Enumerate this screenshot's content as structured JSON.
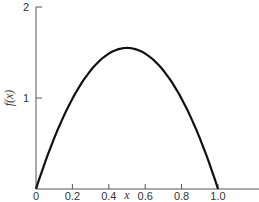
{
  "chart_data": {
    "type": "line",
    "title": "",
    "xlabel": "x",
    "ylabel": "f(x)",
    "xlim": [
      0,
      1.2
    ],
    "ylim": [
      0,
      2
    ],
    "grid": false,
    "legend": null,
    "x_ticks": [
      "0",
      "0.2",
      "0.4",
      "0.6",
      "0.8",
      "1.0"
    ],
    "y_ticks": [
      "1",
      "2"
    ],
    "series": [
      {
        "name": "f(x)",
        "x": [
          0,
          0.05,
          0.1,
          0.15,
          0.2,
          0.25,
          0.3,
          0.35,
          0.4,
          0.45,
          0.5,
          0.55,
          0.6,
          0.65,
          0.7,
          0.75,
          0.8,
          0.85,
          0.9,
          0.95,
          1.0
        ],
        "values": [
          0,
          0.29,
          0.56,
          0.79,
          0.99,
          1.16,
          1.3,
          1.41,
          1.49,
          1.53,
          1.55,
          1.53,
          1.49,
          1.41,
          1.3,
          1.16,
          0.99,
          0.79,
          0.56,
          0.29,
          0
        ]
      }
    ],
    "peak": {
      "x": 0.5,
      "y": 1.55
    }
  }
}
